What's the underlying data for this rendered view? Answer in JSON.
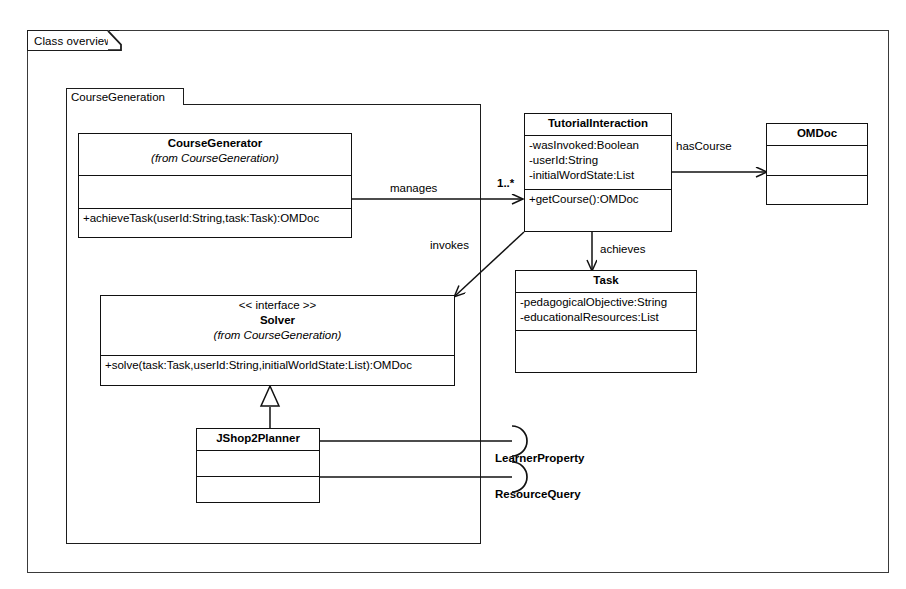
{
  "diagram": {
    "frame_tab_label": "Class overview",
    "package": {
      "name": "CourseGeneration"
    },
    "classes": {
      "course_generator": {
        "name": "CourseGenerator",
        "from": "(from CourseGeneration)",
        "attributes": [],
        "operations": [
          "+achieveTask(userId:String,task:Task):OMDoc"
        ]
      },
      "tutorial_interaction": {
        "name": "TutorialInteraction",
        "attributes": [
          "-wasInvoked:Boolean",
          "-userId:String",
          "-initialWordState:List"
        ],
        "operations": [
          "+getCourse():OMDoc"
        ]
      },
      "omdoc": {
        "name": "OMDoc",
        "attributes": [],
        "operations": []
      },
      "task": {
        "name": "Task",
        "attributes": [
          "-pedagogicalObjective:String",
          "-educationalResources:List"
        ],
        "operations": []
      },
      "solver": {
        "stereotype": "<< interface >>",
        "name": "Solver",
        "from": "(from CourseGeneration)",
        "operations": [
          "+solve(task:Task,userId:String,initialWorldState:List):OMDoc"
        ]
      },
      "jshop2planner": {
        "name": "JShop2Planner",
        "attributes": [],
        "operations": []
      }
    },
    "relations": {
      "manages": {
        "label": "manages",
        "multiplicity": "1..*"
      },
      "has_course": {
        "label": "hasCourse"
      },
      "invokes": {
        "label": "invokes"
      },
      "achieves": {
        "label": "achieves"
      },
      "realization": {
        "label": ""
      }
    },
    "interfaces": [
      {
        "label": "LearnerProperty"
      },
      {
        "label": "ResourceQuery"
      }
    ],
    "colors": {
      "line": "#111111",
      "frame_line": "#3a3a3a",
      "background": "#ffffff"
    }
  }
}
